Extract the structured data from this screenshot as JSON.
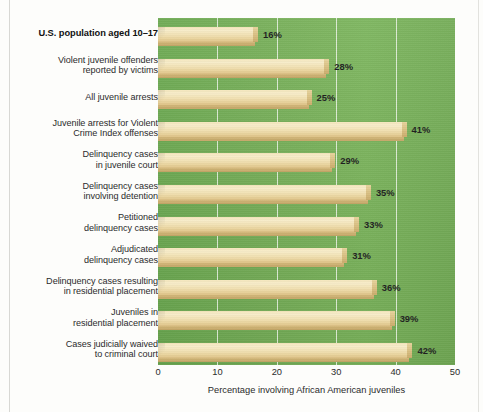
{
  "chart_data": {
    "type": "bar",
    "orientation": "horizontal",
    "title": "",
    "xlabel": "Percentage involving African American juveniles",
    "ylabel": "",
    "xlim": [
      0,
      50
    ],
    "xticks": [
      0,
      10,
      20,
      30,
      40,
      50
    ],
    "xtick_labels": [
      "0",
      "10",
      "20",
      "30",
      "40",
      "50"
    ],
    "grid": "vertical",
    "legend": "none",
    "bar_color": "#f0dfaf",
    "plot_background": "#74ad56",
    "categories": [
      "U.S. population aged 10–17",
      "Violent juvenile offenders reported by victims",
      "All juvenile arrests",
      "Juvenile arrests for Violent Crime Index offenses",
      "Delinquency cases in juvenile court",
      "Delinquency cases involving detention",
      "Petitioned delinquency cases",
      "Adjudicated delinquency cases",
      "Delinquency cases resulting in residential placement",
      "Juveniles in residential placement",
      "Cases judicially waived to criminal court"
    ],
    "values": [
      16,
      28,
      25,
      41,
      29,
      35,
      33,
      31,
      36,
      39,
      42
    ],
    "data_labels": [
      "16%",
      "28%",
      "25%",
      "41%",
      "29%",
      "35%",
      "33%",
      "31%",
      "36%",
      "39%",
      "42%"
    ]
  },
  "rows": [
    {
      "label_lines": [
        "U.S. population aged 10–17"
      ],
      "emphasis": "bold",
      "value": 16,
      "data_label": "16%"
    },
    {
      "label_lines": [
        "Violent juvenile offenders",
        "reported by victims"
      ],
      "emphasis": "normal",
      "value": 28,
      "data_label": "28%"
    },
    {
      "label_lines": [
        "All juvenile arrests"
      ],
      "emphasis": "normal",
      "value": 25,
      "data_label": "25%"
    },
    {
      "label_lines": [
        "Juvenile arrests for Violent",
        "Crime Index offenses"
      ],
      "emphasis": "normal",
      "value": 41,
      "data_label": "41%"
    },
    {
      "label_lines": [
        "Delinquency cases",
        "in juvenile court"
      ],
      "emphasis": "normal",
      "value": 29,
      "data_label": "29%"
    },
    {
      "label_lines": [
        "Delinquency cases",
        "involving detention"
      ],
      "emphasis": "normal",
      "value": 35,
      "data_label": "35%"
    },
    {
      "label_lines": [
        "Petitioned",
        "delinquency cases"
      ],
      "emphasis": "normal",
      "value": 33,
      "data_label": "33%"
    },
    {
      "label_lines": [
        "Adjudicated",
        "delinquency cases"
      ],
      "emphasis": "normal",
      "value": 31,
      "data_label": "31%"
    },
    {
      "label_lines": [
        "Delinquency cases resulting",
        "in residential placement"
      ],
      "emphasis": "normal",
      "value": 36,
      "data_label": "36%"
    },
    {
      "label_lines": [
        "Juveniles in",
        "residential placement"
      ],
      "emphasis": "normal",
      "value": 39,
      "data_label": "39%"
    },
    {
      "label_lines": [
        "Cases judicially waived",
        "to criminal court"
      ],
      "emphasis": "normal",
      "value": 42,
      "data_label": "42%"
    }
  ],
  "axis": {
    "title": "Percentage involving African American juveniles",
    "ticks": [
      "0",
      "10",
      "20",
      "30",
      "40",
      "50"
    ]
  },
  "colors": {
    "plot_green": "#74ad56",
    "bar_tan": "#f0dfaf",
    "bar_shadow": "#c9ab6b",
    "gridline": "#ffffff",
    "text": "#2b2b2b"
  }
}
